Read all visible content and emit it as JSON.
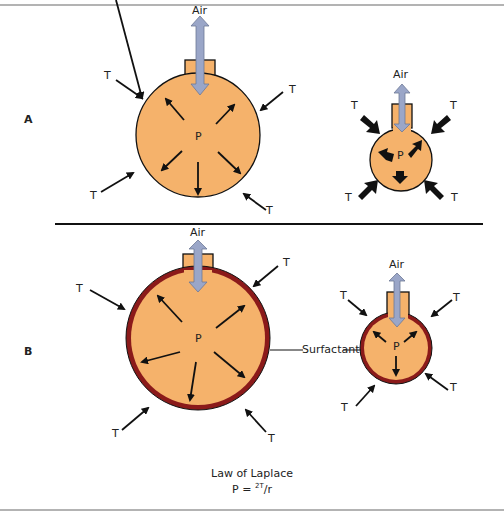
{
  "panels": [
    {
      "label": "A",
      "left": {
        "air": "Air",
        "pressure": "P",
        "tension": [
          "T",
          "T",
          "T",
          "T"
        ]
      },
      "right": {
        "air": "Air",
        "pressure": "P",
        "tension": [
          "T",
          "T",
          "T",
          "T"
        ]
      }
    },
    {
      "label": "B",
      "left": {
        "air": "Air",
        "pressure": "P",
        "tension": [
          "T",
          "T",
          "T",
          "T"
        ]
      },
      "right": {
        "air": "Air",
        "pressure": "P",
        "tension": [
          "T",
          "T",
          "T",
          "T"
        ]
      },
      "surfactant": "Surfactant"
    }
  ],
  "caption": {
    "title": "Law of Laplace",
    "formula_prefix": "P = ",
    "formula_sup": "2T",
    "formula_suffix": "/r"
  },
  "colors": {
    "alveolus": "#f5b26b",
    "surfactant": "#8b1a1a",
    "air_arrow": "#9aa6c8",
    "ink": "#111111",
    "border": "#9a9a9a"
  }
}
